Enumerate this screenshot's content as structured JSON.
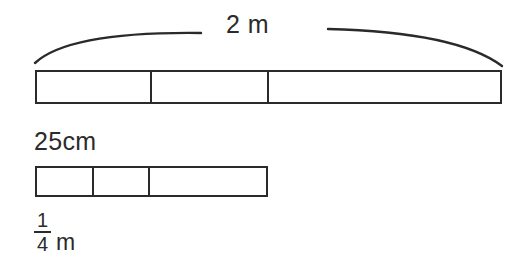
{
  "diagram": {
    "type": "fraction-bar-measurement-diagram",
    "background_color": "#ffffff",
    "line_color": "#2a2a2a",
    "text_color": "#2b2b2b",
    "top": {
      "brace_label": "2 m",
      "bar": {
        "total_label": "2 m",
        "segments": 3,
        "cells": [
          {
            "index": 1,
            "width_px": 115
          },
          {
            "index": 2,
            "width_px": 117
          },
          {
            "index": 3,
            "width_px": 235
          }
        ]
      }
    },
    "bottom": {
      "top_label": "25cm",
      "bar": {
        "segments": 3,
        "cells": [
          {
            "index": 1,
            "width_px": 57
          },
          {
            "index": 2,
            "width_px": 56
          },
          {
            "index": 3,
            "width_px": 120
          }
        ]
      },
      "fraction_label": {
        "numerator": "1",
        "denominator": "4",
        "unit": "m",
        "full_text": "1/4 m"
      }
    }
  }
}
